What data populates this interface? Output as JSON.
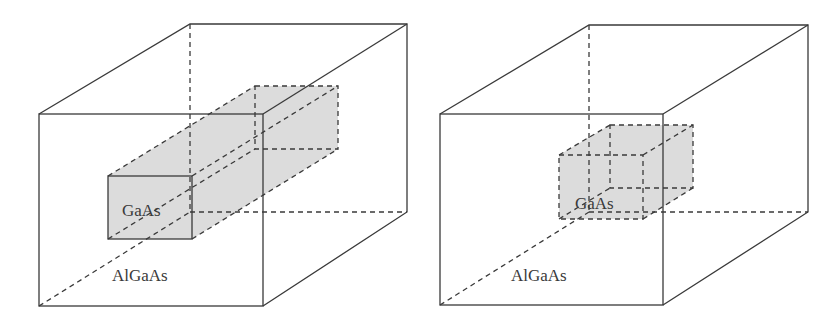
{
  "diagrams": [
    {
      "name": "quantum-wire",
      "inner_label": "GaAs",
      "outer_label": "AlGaAs"
    },
    {
      "name": "quantum-dot",
      "inner_label": "GaAs",
      "outer_label": "AlGaAs"
    }
  ],
  "colors": {
    "line": "#3a3a3a",
    "inner_fill": "#dcdcdc",
    "background": "#ffffff"
  }
}
